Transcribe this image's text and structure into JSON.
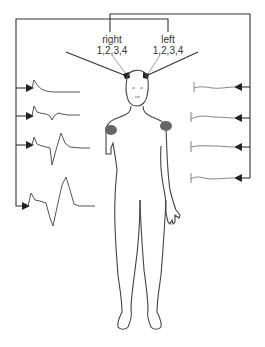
{
  "diagram": {
    "labels": {
      "right_title": "right",
      "right_electrodes": "1,2,3,4",
      "left_title": "left",
      "left_electrodes": "1,2,3,4"
    },
    "left_traces": [
      {
        "name": "trace-1",
        "shape": "small-spike-decay"
      },
      {
        "name": "trace-2",
        "shape": "spike-small-biphasic"
      },
      {
        "name": "trace-3",
        "shape": "spike-medium-biphasic"
      },
      {
        "name": "trace-4",
        "shape": "spike-large-biphasic"
      }
    ],
    "right_traces": [
      {
        "name": "trace-1",
        "shape": "flat"
      },
      {
        "name": "trace-2",
        "shape": "flat"
      },
      {
        "name": "trace-3",
        "shape": "flat"
      },
      {
        "name": "trace-4",
        "shape": "flat"
      }
    ],
    "colors": {
      "line": "#333333",
      "wave": "#555555",
      "shoulder_marker": "#666666"
    }
  }
}
